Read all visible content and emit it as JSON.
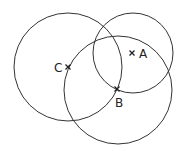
{
  "diagram": {
    "type": "circles",
    "stroke_color": "#333333",
    "circles": [
      {
        "name": "circle-left",
        "cx": 68,
        "cy": 67,
        "r": 54
      },
      {
        "name": "circle-top-right",
        "cx": 133,
        "cy": 53,
        "r": 40
      },
      {
        "name": "circle-bottom",
        "cx": 118,
        "cy": 90,
        "r": 54
      }
    ],
    "points": [
      {
        "label": "C",
        "x": 68,
        "y": 67,
        "label_x": 54,
        "label_y": 72
      },
      {
        "label": "A",
        "x": 132,
        "y": 53,
        "label_x": 139,
        "label_y": 58
      },
      {
        "label": "B",
        "x": 117,
        "y": 89,
        "label_x": 115,
        "label_y": 107
      }
    ]
  }
}
